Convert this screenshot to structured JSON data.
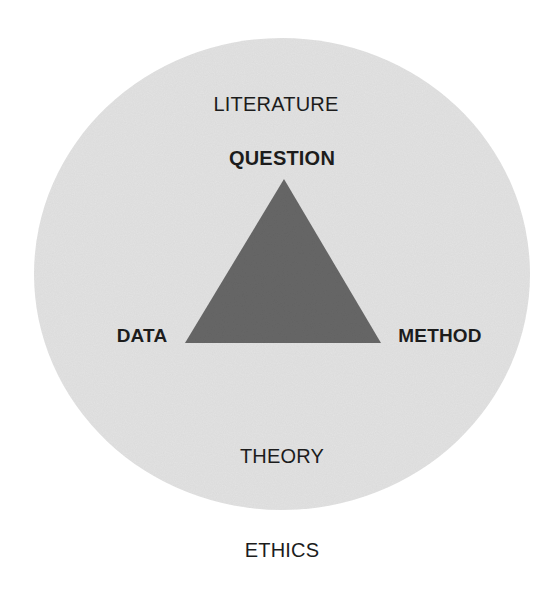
{
  "diagram": {
    "type": "concept-diagram",
    "colors": {
      "background": "#ffffff",
      "circle_fill": "#e3e3e3",
      "triangle_fill": "#676767",
      "text": "#1c1c1c"
    },
    "circle": {
      "cx": 282,
      "cy": 274,
      "rx": 248,
      "ry": 236
    },
    "triangle": {
      "points": "284,179 185,343 381,343"
    },
    "labels": {
      "outer_top": "LITERATURE",
      "apex": "QUESTION",
      "left_vertex": "DATA",
      "right_vertex": "METHOD",
      "inner_bottom": "THEORY",
      "outside_bottom": "ETHICS"
    },
    "nodes": [
      {
        "id": "question",
        "label": "QUESTION",
        "role": "triangle-vertex",
        "emphasis": "bold"
      },
      {
        "id": "data",
        "label": "DATA",
        "role": "triangle-vertex",
        "emphasis": "bold"
      },
      {
        "id": "method",
        "label": "METHOD",
        "role": "triangle-vertex",
        "emphasis": "bold"
      },
      {
        "id": "literature",
        "label": "LITERATURE",
        "role": "context-inside-circle",
        "emphasis": "regular"
      },
      {
        "id": "theory",
        "label": "THEORY",
        "role": "context-inside-circle",
        "emphasis": "regular"
      },
      {
        "id": "ethics",
        "label": "ETHICS",
        "role": "outside-circle",
        "emphasis": "regular"
      }
    ]
  }
}
